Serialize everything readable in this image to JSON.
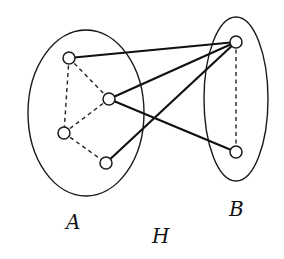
{
  "diagram": {
    "type": "bipartite-graph",
    "title": "H",
    "sets": [
      {
        "id": "A",
        "label": "A",
        "cx": 86,
        "cy": 113,
        "rx": 58,
        "ry": 83,
        "label_x": 66,
        "label_y": 229
      },
      {
        "id": "B",
        "label": "B",
        "cx": 236,
        "cy": 99,
        "rx": 32,
        "ry": 82,
        "label_x": 229,
        "label_y": 216
      }
    ],
    "graph_label": {
      "text": "H",
      "x": 152,
      "y": 243
    },
    "nodes": [
      {
        "id": "a1",
        "set": "A",
        "x": 69,
        "y": 58
      },
      {
        "id": "a2",
        "set": "A",
        "x": 109,
        "y": 99
      },
      {
        "id": "a3",
        "set": "A",
        "x": 64,
        "y": 133
      },
      {
        "id": "a4",
        "set": "A",
        "x": 106,
        "y": 163
      },
      {
        "id": "b1",
        "set": "B",
        "x": 236,
        "y": 42
      },
      {
        "id": "b2",
        "set": "B",
        "x": 236,
        "y": 152
      }
    ],
    "edges_solid": [
      {
        "from": "a1",
        "to": "b1"
      },
      {
        "from": "a2",
        "to": "b1"
      },
      {
        "from": "a4",
        "to": "b1"
      },
      {
        "from": "a2",
        "to": "b2"
      }
    ],
    "edges_dashed": [
      {
        "from": "a1",
        "to": "a2"
      },
      {
        "from": "a1",
        "to": "a3"
      },
      {
        "from": "a2",
        "to": "a3"
      },
      {
        "from": "a3",
        "to": "a4"
      },
      {
        "from": "b1",
        "to": "b2"
      }
    ],
    "node_radius": 6
  }
}
